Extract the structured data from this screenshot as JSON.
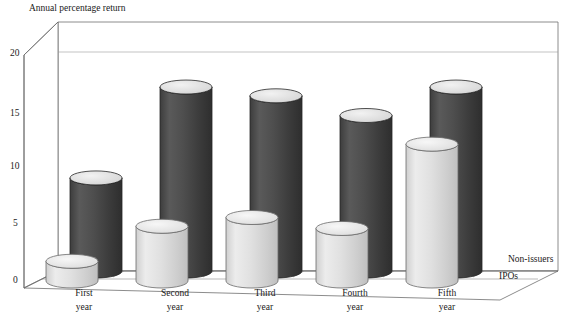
{
  "chart_data": {
    "type": "bar",
    "title": "Annual percentage return",
    "xlabel": "",
    "ylabel": "Annual percentage return",
    "ylim": [
      0,
      20
    ],
    "yticks": [
      0,
      5,
      10,
      15,
      20
    ],
    "grid": true,
    "legend_position": "right",
    "style": "3d-cylinder",
    "categories": [
      "First year",
      "Second year",
      "Third year",
      "Fourth year",
      "Fifth year"
    ],
    "category_lines": [
      [
        "First",
        "year"
      ],
      [
        "Second",
        "year"
      ],
      [
        "Third",
        "year"
      ],
      [
        "Fourth",
        "year"
      ],
      [
        "Fifth",
        "year"
      ]
    ],
    "series": [
      {
        "name": "Non-issuers",
        "color": "#4a4a4a",
        "values": [
          8.5,
          16.8,
          16.0,
          14.2,
          16.8
        ]
      },
      {
        "name": "IPOs",
        "color": "#dcdcdc",
        "values": [
          1.8,
          5.0,
          5.8,
          4.8,
          12.5
        ]
      }
    ]
  },
  "axis": {
    "y_title": "Annual percentage return",
    "tick_labels": [
      "20",
      "15",
      "10",
      "5",
      "0"
    ]
  },
  "legend": {
    "entries": [
      {
        "label": "Non-issuers"
      },
      {
        "label": "IPOs"
      }
    ]
  },
  "colors": {
    "dark_fill": "#4a4a4a",
    "dark_top": "#e8e8e8",
    "light_fill": "#dcdcdc",
    "light_top": "#f0f0f0",
    "outline": "#3a3a3a",
    "grid": "#8a8a8a",
    "background": "#ffffff"
  }
}
